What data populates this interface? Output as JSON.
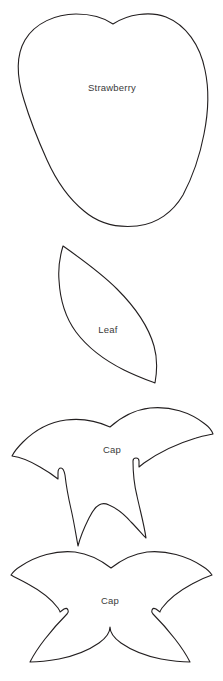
{
  "sheet": {
    "title": "Strawberry Pattern Template",
    "background_color": "#ffffff",
    "outline_color": "#231f20",
    "label_color": "#3a3a3a",
    "width": 223,
    "height": 681
  },
  "pieces": [
    {
      "id": "strawberry-body",
      "label": "Strawberry",
      "label_x": 112,
      "label_y": 88,
      "shape": "berry",
      "bounds": {
        "x": 14,
        "y": 12,
        "width": 194,
        "height": 214
      }
    },
    {
      "id": "leaf",
      "label": "Leaf",
      "label_x": 108,
      "label_y": 330,
      "shape": "leaf",
      "bounds": {
        "x": 58,
        "y": 244,
        "width": 100,
        "height": 141
      }
    },
    {
      "id": "cap-three-lobe",
      "label": "Cap",
      "label_x": 112,
      "label_y": 450,
      "shape": "calyx-3",
      "bounds": {
        "x": 10,
        "y": 408,
        "width": 203,
        "height": 133
      }
    },
    {
      "id": "cap-four-lobe",
      "label": "Cap",
      "label_x": 110,
      "label_y": 601,
      "shape": "calyx-4",
      "bounds": {
        "x": 11,
        "y": 551,
        "width": 201,
        "height": 124
      }
    }
  ]
}
